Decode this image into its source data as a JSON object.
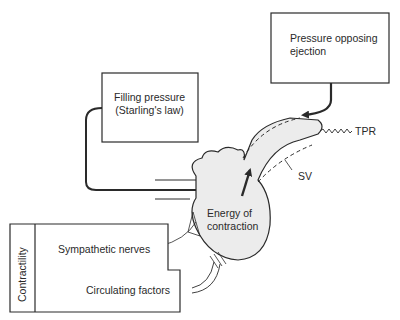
{
  "diagram": {
    "boxes": {
      "pressure_opposing": {
        "line1": "Pressure opposing",
        "line2": "ejection"
      },
      "filling_pressure": {
        "line1": "Filling pressure",
        "line2": "(Starling's law)"
      },
      "contractility": {
        "title": "Contractility",
        "item1": "Sympathetic nerves",
        "item2": "Circulating factors"
      }
    },
    "heart": {
      "line1": "Energy of",
      "line2": "contraction"
    },
    "labels": {
      "tpr": "TPR",
      "sv": "SV"
    },
    "colors": {
      "stroke": "#2a2a2a",
      "heart_fill": "#ececec",
      "background": "#ffffff"
    }
  }
}
